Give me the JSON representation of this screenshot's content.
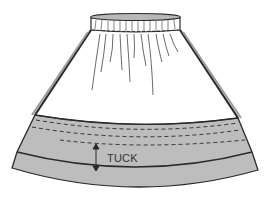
{
  "diagram": {
    "labels": {
      "tuck": "TUCK"
    },
    "colors": {
      "background": "#ffffff",
      "line": "#2a2a2a",
      "band_fill": "#bdbdbd",
      "waistband_fill": "#c8c8c8"
    },
    "parts": [
      "waistband",
      "gathered-skirt-body",
      "hem-band",
      "tuck-fold",
      "tuck-measure-arrow"
    ]
  }
}
